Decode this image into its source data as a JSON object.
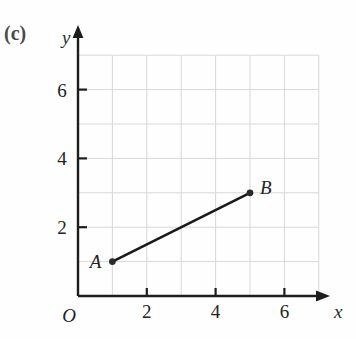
{
  "figure": {
    "part_label": "(c)",
    "background_color": "#fefefe"
  },
  "chart_data": {
    "type": "scatter",
    "title": "",
    "subtitle": "",
    "xlabel": "x",
    "ylabel": "y",
    "origin_label": "O",
    "xlim": [
      0,
      7
    ],
    "ylim": [
      0,
      7
    ],
    "xticks": [
      2,
      4,
      6
    ],
    "xtick_labels": [
      "2",
      "4",
      "6"
    ],
    "yticks": [
      2,
      4,
      6
    ],
    "ytick_labels": [
      "2",
      "4",
      "6"
    ],
    "grid": true,
    "grid_step": 1,
    "grid_color": "#d8d8dc",
    "axis_color": "#1c1c1c",
    "legend": "none",
    "points": [
      {
        "name": "A",
        "x": 1,
        "y": 1,
        "label": "A",
        "label_position": "left"
      },
      {
        "name": "B",
        "x": 5,
        "y": 3,
        "label": "B",
        "label_position": "right"
      }
    ],
    "segments": [
      {
        "name": "AB",
        "from": "A",
        "to": "B",
        "color": "#1a1a1a",
        "style": "solid"
      }
    ],
    "annotations": [
      "(c)"
    ]
  }
}
